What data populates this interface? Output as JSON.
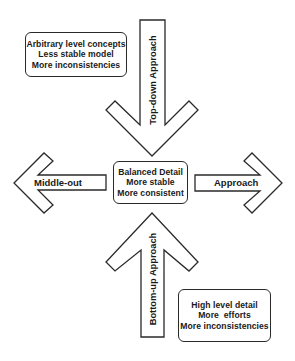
{
  "diagram": {
    "type": "approach-directions",
    "arrows": {
      "top": {
        "label": "Top-down Approach",
        "direction": "down"
      },
      "bottom": {
        "label": "Bottom-up Approach",
        "direction": "up"
      },
      "left": {
        "label": "Middle-out",
        "direction": "left"
      },
      "right": {
        "label": "Approach",
        "direction": "right"
      }
    },
    "boxes": {
      "top_left": {
        "lines": [
          "Arbitrary level concepts",
          "Less stable model",
          "More inconsistencies"
        ]
      },
      "center": {
        "lines": [
          "Balanced Detail",
          "More stable",
          "More consistent"
        ]
      },
      "bottom_right": {
        "lines": [
          "High level detail",
          "More  efforts",
          "More inconsistencies"
        ]
      }
    },
    "colors": {
      "stroke": "#2a2a2a",
      "fill": "#ffffff",
      "text": "#1a1a1a"
    }
  }
}
